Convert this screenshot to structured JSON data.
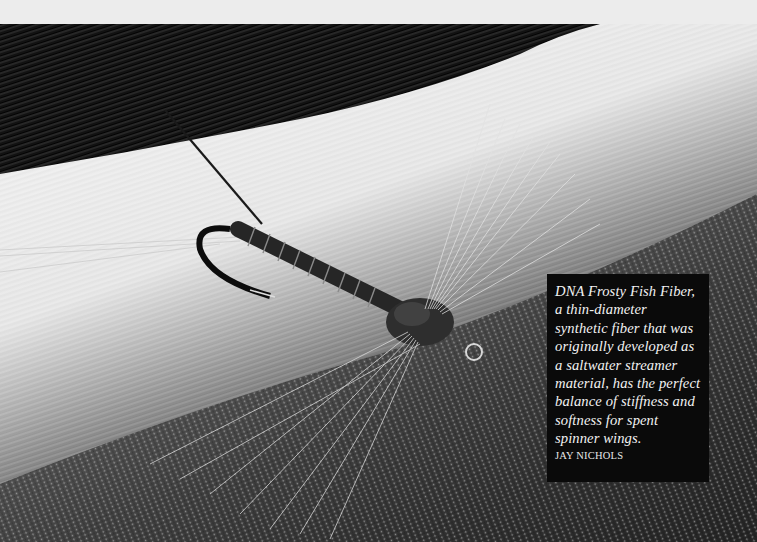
{
  "caption": {
    "text": "DNA Frosty Fish Fiber, a thin-diameter synthetic fiber that was originally developed as a saltwater streamer material, has the perfect balance of stiffness and softness for spent spinner wings.",
    "credit": "JAY NICHOLS"
  },
  "photo": {
    "subject": "spent spinner fly on a hook resting on fiber material",
    "style": "black-and-white"
  },
  "colors": {
    "page_background": "#ececec",
    "caption_background": "#0a0a0a",
    "caption_text": "#f2f2f2"
  }
}
